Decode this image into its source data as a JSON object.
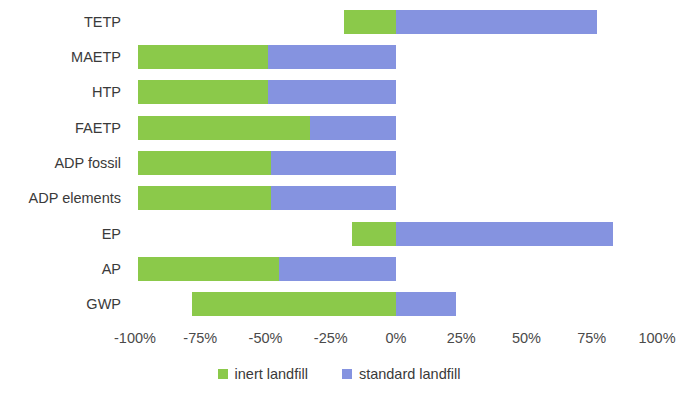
{
  "chart_data": {
    "type": "bar",
    "orientation": "horizontal",
    "stacked": true,
    "title": "",
    "xlabel": "",
    "ylabel": "",
    "xlim": [
      -100,
      100
    ],
    "xticks": [
      -100,
      -75,
      -50,
      -25,
      0,
      25,
      50,
      75,
      100
    ],
    "xtick_labels": [
      "-100%",
      "-75%",
      "-50%",
      "-25%",
      "0%",
      "25%",
      "50%",
      "75%",
      "100%"
    ],
    "grid": false,
    "legend_position": "bottom",
    "categories": [
      "TETP",
      "MAETP",
      "HTP",
      "FAETP",
      "ADP fossil",
      "ADP elements",
      "EP",
      "AP",
      "GWP"
    ],
    "series": [
      {
        "name": "inert landfill",
        "color": "#8BC94A",
        "values": [
          -20,
          -50,
          -50,
          -66,
          -51,
          -51,
          -17,
          -54,
          -78
        ]
      },
      {
        "name": "standard landfill",
        "color": "#8593E0",
        "values": [
          77,
          -49,
          -49,
          -33,
          -48,
          -48,
          83,
          -45,
          23
        ]
      }
    ]
  },
  "legend": {
    "items": [
      {
        "label": "inert landfill",
        "color": "#8BC94A"
      },
      {
        "label": "standard landfill",
        "color": "#8593E0"
      }
    ]
  }
}
